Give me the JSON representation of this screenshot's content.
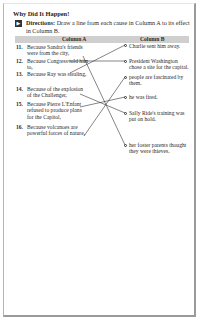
{
  "worksheet": {
    "title": "Why Did It Happen!",
    "directions_icon": "arrow-right-icon",
    "directions_label": "Directions:",
    "directions_text": " Draw a line from each cause in Column A to its effect in Column B.",
    "columns": {
      "a": "Column A",
      "b": "Column B"
    },
    "causes": [
      {
        "num": "11.",
        "text": "Because Sandra's friends were from the city,"
      },
      {
        "num": "12.",
        "text": "Because Congress told him to,"
      },
      {
        "num": "13.",
        "text": "Because Ray was stealing,"
      },
      {
        "num": "14.",
        "text": "Because of the explosion of the Challenger,"
      },
      {
        "num": "15.",
        "text": "Because Pierre L'Enfant refused to produce plans for the Capitol,"
      },
      {
        "num": "16.",
        "text": "Because volcanoes are powerful forces of nature,"
      }
    ],
    "effects": [
      {
        "text": "Charlie sent him away."
      },
      {
        "text": "President Washington chose a site for the capital."
      },
      {
        "text": "people are fascinated by them."
      },
      {
        "text": "he was fired."
      },
      {
        "text": "Sally Ride's training was put on hold."
      },
      {
        "text": "her foster parents thought they were thieves."
      }
    ],
    "matches": [
      {
        "cause": "11.",
        "effect": "her foster parents thought they were thieves."
      },
      {
        "cause": "12.",
        "effect": "President Washington chose a site for the capital."
      },
      {
        "cause": "13.",
        "effect": "Charlie sent him away."
      },
      {
        "cause": "14.",
        "effect": "Sally Ride's training was put on hold."
      },
      {
        "cause": "15.",
        "effect": "he was fired."
      },
      {
        "cause": "16.",
        "effect": "people are fascinated by them."
      }
    ]
  }
}
